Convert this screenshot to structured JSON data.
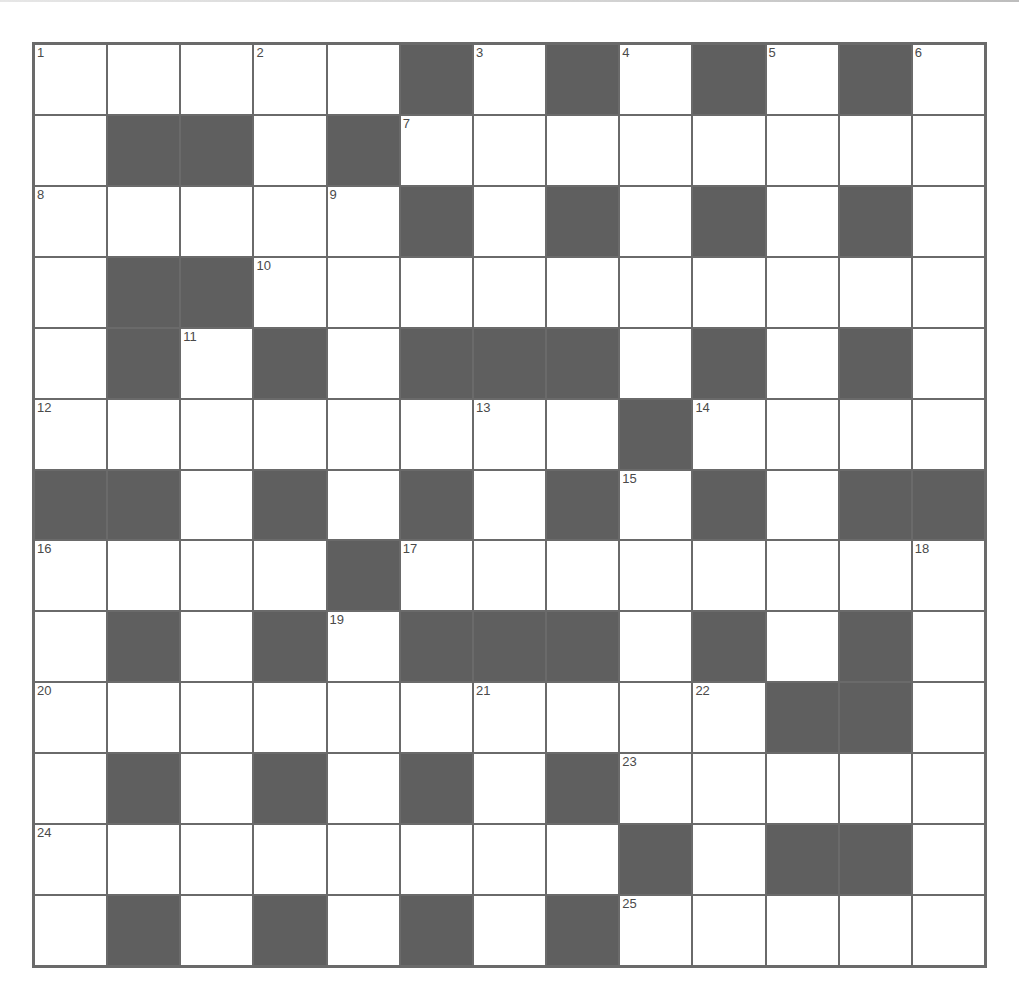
{
  "puzzle": {
    "type": "crossword",
    "rows": 13,
    "cols": 13,
    "colors": {
      "block": "#5f5f5f",
      "grid_line": "#6a6a6a",
      "open": "#ffffff",
      "number_text": "#4a4a4a"
    },
    "pattern": [
      ".....#.#.#.#.",
      ".##.#........",
      ".....#.#.#.#.",
      ".##..........",
      ".#.#.###.#.#.",
      "........#....",
      "##.#.#.#.#.##",
      "....#........",
      ".#.#.###.#.#.",
      "..........##.",
      ".#.#.#.#.....",
      "........#.##.",
      ".#.#.#.#....."
    ],
    "numbers": [
      {
        "row": 0,
        "col": 0,
        "n": "1"
      },
      {
        "row": 0,
        "col": 3,
        "n": "2"
      },
      {
        "row": 0,
        "col": 6,
        "n": "3"
      },
      {
        "row": 0,
        "col": 8,
        "n": "4"
      },
      {
        "row": 0,
        "col": 10,
        "n": "5"
      },
      {
        "row": 0,
        "col": 12,
        "n": "6"
      },
      {
        "row": 1,
        "col": 5,
        "n": "7"
      },
      {
        "row": 2,
        "col": 0,
        "n": "8"
      },
      {
        "row": 2,
        "col": 4,
        "n": "9"
      },
      {
        "row": 3,
        "col": 3,
        "n": "10"
      },
      {
        "row": 4,
        "col": 2,
        "n": "11"
      },
      {
        "row": 5,
        "col": 0,
        "n": "12"
      },
      {
        "row": 5,
        "col": 6,
        "n": "13"
      },
      {
        "row": 5,
        "col": 9,
        "n": "14"
      },
      {
        "row": 6,
        "col": 8,
        "n": "15"
      },
      {
        "row": 7,
        "col": 0,
        "n": "16"
      },
      {
        "row": 7,
        "col": 5,
        "n": "17"
      },
      {
        "row": 7,
        "col": 12,
        "n": "18"
      },
      {
        "row": 8,
        "col": 4,
        "n": "19"
      },
      {
        "row": 9,
        "col": 0,
        "n": "20"
      },
      {
        "row": 9,
        "col": 6,
        "n": "21"
      },
      {
        "row": 9,
        "col": 9,
        "n": "22"
      },
      {
        "row": 10,
        "col": 8,
        "n": "23"
      },
      {
        "row": 11,
        "col": 0,
        "n": "24"
      },
      {
        "row": 12,
        "col": 8,
        "n": "25"
      }
    ],
    "entries": {}
  }
}
